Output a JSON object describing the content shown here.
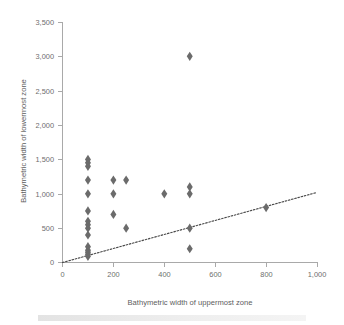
{
  "chart_data": {
    "type": "scatter",
    "title": "",
    "xlabel": "Bathymetric width of uppermost zone",
    "ylabel": "Bathymetric width of lowermost zone",
    "xlim": [
      0,
      1000
    ],
    "ylim": [
      0,
      3500
    ],
    "xticks": [
      0,
      200,
      400,
      600,
      800,
      1000
    ],
    "yticks": [
      0,
      500,
      1000,
      1500,
      2000,
      2500,
      3000,
      3500
    ],
    "xtick_labels": [
      "0",
      "200",
      "400",
      "600",
      "800",
      "1,000"
    ],
    "ytick_labels": [
      "0",
      "500",
      "1,000",
      "1,500",
      "2,000",
      "2,500",
      "3,000",
      "3,500"
    ],
    "grid": false,
    "legend": null,
    "marker_shape": "diamond",
    "marker_color": "#6b6b6b",
    "series": [
      {
        "name": "Zone width pairs",
        "points": [
          [
            100,
            1500
          ],
          [
            100,
            1450
          ],
          [
            100,
            1400
          ],
          [
            100,
            1200
          ],
          [
            100,
            1000
          ],
          [
            100,
            750
          ],
          [
            100,
            600
          ],
          [
            100,
            550
          ],
          [
            100,
            500
          ],
          [
            100,
            400
          ],
          [
            100,
            230
          ],
          [
            100,
            180
          ],
          [
            100,
            150
          ],
          [
            100,
            120
          ],
          [
            100,
            90
          ],
          [
            200,
            1200
          ],
          [
            200,
            1000
          ],
          [
            200,
            700
          ],
          [
            250,
            1200
          ],
          [
            250,
            500
          ],
          [
            400,
            1000
          ],
          [
            500,
            3000
          ],
          [
            500,
            1100
          ],
          [
            500,
            1000
          ],
          [
            500,
            500
          ],
          [
            500,
            200
          ],
          [
            800,
            800
          ]
        ]
      }
    ],
    "trendline": {
      "style": "dotted",
      "color": "#4a4a4a",
      "x_start": 0,
      "y_start": 0,
      "x_end": 1000,
      "y_end": 1020
    }
  },
  "axes": {
    "x_title": "Bathymetric width of uppermost zone",
    "y_title": "Bathymetric width of lowermost zone"
  }
}
